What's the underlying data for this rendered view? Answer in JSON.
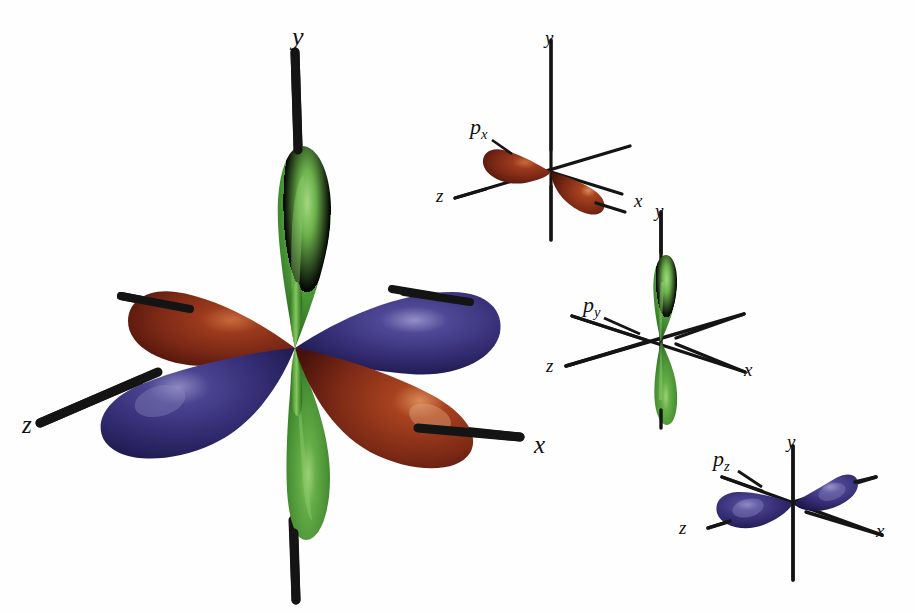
{
  "figure": {
    "type": "orbital-diagram",
    "background_color": "#ffffff"
  },
  "colors": {
    "px_red_dark": "#5d1a0f",
    "px_red_mid": "#8c3018",
    "px_red_light": "#b8552c",
    "px_red_highlight": "#d8916a",
    "py_green_dark": "#2f6b22",
    "py_green_mid": "#4f9a36",
    "py_green_light": "#72b84e",
    "py_green_highlight": "#a6d77f",
    "pz_blue_dark": "#221c55",
    "pz_blue_mid": "#383173",
    "pz_blue_light": "#554e94",
    "pz_blue_highlight": "#8a86bd",
    "axis_black": "#141414"
  },
  "main_panel": {
    "name": "combined-p-orbitals",
    "origin": {
      "x": 295,
      "y": 348
    },
    "axis_labels": [
      {
        "id": "y",
        "text": "y",
        "x": 292,
        "y": 24
      },
      {
        "id": "z",
        "text": "z",
        "x": 22,
        "y": 412
      },
      {
        "id": "x",
        "text": "x",
        "x": 534,
        "y": 432
      }
    ],
    "lobes": [
      {
        "orbital": "py",
        "direction": "up",
        "color_key": "py_green"
      },
      {
        "orbital": "py",
        "direction": "down",
        "color_key": "py_green"
      },
      {
        "orbital": "px",
        "direction": "upper-left",
        "color_key": "px_red"
      },
      {
        "orbital": "px",
        "direction": "lower-right",
        "color_key": "px_red"
      },
      {
        "orbital": "pz",
        "direction": "lower-left",
        "color_key": "pz_blue"
      },
      {
        "orbital": "pz",
        "direction": "upper-right",
        "color_key": "pz_blue"
      }
    ]
  },
  "small_panels": [
    {
      "id": "px",
      "name": "px-orbital-panel",
      "orbital_label": "p",
      "orbital_subscript": "x",
      "label_pos": {
        "x": 470,
        "y": 118
      },
      "origin": {
        "x": 551,
        "y": 172
      },
      "color_key": "px_red",
      "axis_labels": [
        {
          "id": "y",
          "text": "y",
          "x": 545,
          "y": 30
        },
        {
          "id": "z",
          "text": "z",
          "x": 436,
          "y": 186
        },
        {
          "id": "x",
          "text": "x",
          "x": 634,
          "y": 191
        }
      ]
    },
    {
      "id": "py",
      "name": "py-orbital-panel",
      "orbital_label": "p",
      "orbital_subscript": "y",
      "label_pos": {
        "x": 583,
        "y": 296
      },
      "origin": {
        "x": 661,
        "y": 341
      },
      "color_key": "py_green",
      "axis_labels": [
        {
          "id": "y",
          "text": "y",
          "x": 655,
          "y": 203
        },
        {
          "id": "z",
          "text": "z",
          "x": 546,
          "y": 356
        },
        {
          "id": "x",
          "text": "x",
          "x": 744,
          "y": 360
        }
      ]
    },
    {
      "id": "pz",
      "name": "pz-orbital-panel",
      "orbital_label": "p",
      "orbital_subscript": "z",
      "label_pos": {
        "x": 713,
        "y": 450
      },
      "origin": {
        "x": 793,
        "y": 503
      },
      "color_key": "pz_blue",
      "axis_labels": [
        {
          "id": "y",
          "text": "y",
          "x": 787,
          "y": 434
        },
        {
          "id": "z",
          "text": "z",
          "x": 679,
          "y": 518
        },
        {
          "id": "x",
          "text": "x",
          "x": 876,
          "y": 521
        }
      ]
    }
  ]
}
